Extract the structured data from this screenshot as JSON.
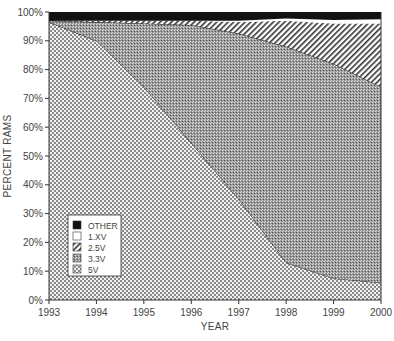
{
  "chart_data": {
    "type": "area",
    "stacked": true,
    "title": "",
    "xlabel": "YEAR",
    "ylabel": "PERCENT RAMS",
    "x": [
      1993,
      1994,
      1995,
      1996,
      1997,
      1998,
      1999,
      2000
    ],
    "ylim": [
      0,
      100
    ],
    "yticks": [
      "0%",
      "10%",
      "20%",
      "30%",
      "40%",
      "50%",
      "60%",
      "70%",
      "80%",
      "90%",
      "100%"
    ],
    "xticks": [
      "1993",
      "1994",
      "1995",
      "1996",
      "1997",
      "1998",
      "1999",
      "2000"
    ],
    "legend_position": "lower-left inside",
    "series": [
      {
        "name": "5V",
        "pattern": "checker-coarse",
        "values": [
          96.5,
          90,
          74,
          54.5,
          35,
          13,
          7.5,
          6
        ]
      },
      {
        "name": "3.3V",
        "pattern": "checker-fine-dark",
        "values": [
          0.5,
          6.5,
          22,
          41,
          57.5,
          75,
          74.5,
          68
        ]
      },
      {
        "name": "2.5V",
        "pattern": "diagonal-hatch",
        "values": [
          0,
          0.5,
          1,
          1.5,
          4,
          9,
          14,
          22
        ]
      },
      {
        "name": "1.XV",
        "pattern": "white",
        "values": [
          0,
          0,
          0,
          0,
          0.5,
          0.7,
          1.2,
          1.5
        ]
      },
      {
        "name": "OTHER",
        "pattern": "solid-black",
        "values": [
          3,
          3,
          3,
          3,
          3,
          2.3,
          2.8,
          2.5
        ]
      }
    ],
    "cumulative_tops": {
      "5V": [
        96.5,
        90,
        74,
        54.5,
        35,
        13,
        7.5,
        6
      ],
      "3.3V": [
        97,
        96.5,
        96,
        95.5,
        92.5,
        88,
        82,
        74
      ],
      "2.5V": [
        97,
        97,
        97,
        97,
        96.5,
        97,
        96,
        96
      ],
      "1.XV": [
        97,
        97,
        97,
        97,
        97,
        97.7,
        97.2,
        97.5
      ],
      "OTHER": [
        100,
        100,
        100,
        100,
        100,
        100,
        100,
        100
      ]
    }
  },
  "legend": {
    "items": [
      {
        "label": "OTHER"
      },
      {
        "label": "1.XV"
      },
      {
        "label": "2.5V"
      },
      {
        "label": "3.3V"
      },
      {
        "label": "5V"
      }
    ]
  },
  "axes": {
    "x_title": "YEAR",
    "y_title": "PERCENT RAMS"
  }
}
